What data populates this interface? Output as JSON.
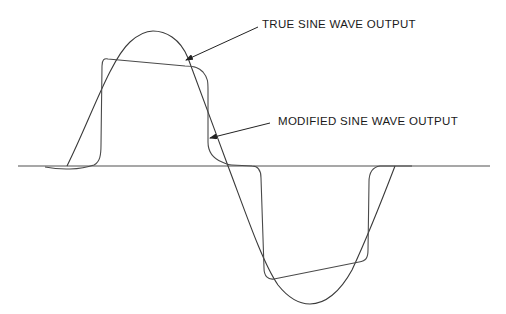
{
  "diagram": {
    "title": "",
    "labels": {
      "true_sine": "TRUE SINE WAVE OUTPUT",
      "modified_sine": "MODIFIED SINE WAVE OUTPUT"
    },
    "colors": {
      "baseline": "#8a8a8a",
      "true_sine": "#3a3a3a",
      "modified_sine": "#4a4a4a",
      "text": "#1a1a1a",
      "background": "#ffffff"
    },
    "series": [
      {
        "name": "True sine wave output",
        "shape": "sinusoid, one full cycle"
      },
      {
        "name": "Modified sine wave output",
        "shape": "stepped quasi-square wave with dead time at zero"
      }
    ]
  }
}
